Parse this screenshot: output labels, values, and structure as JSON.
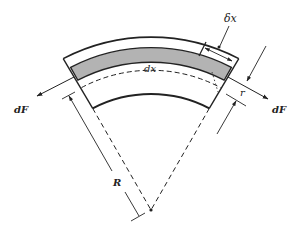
{
  "diagram": {
    "type": "curved beam element free-body diagram",
    "labels": {
      "delta_x": "δx",
      "dx": "dx",
      "force_left": "dF",
      "force_right": "dF",
      "r": "r",
      "R": "R"
    },
    "colors": {
      "stroke": "#222222",
      "shaded_band": "#b3b3b3",
      "background": "#ffffff"
    }
  }
}
